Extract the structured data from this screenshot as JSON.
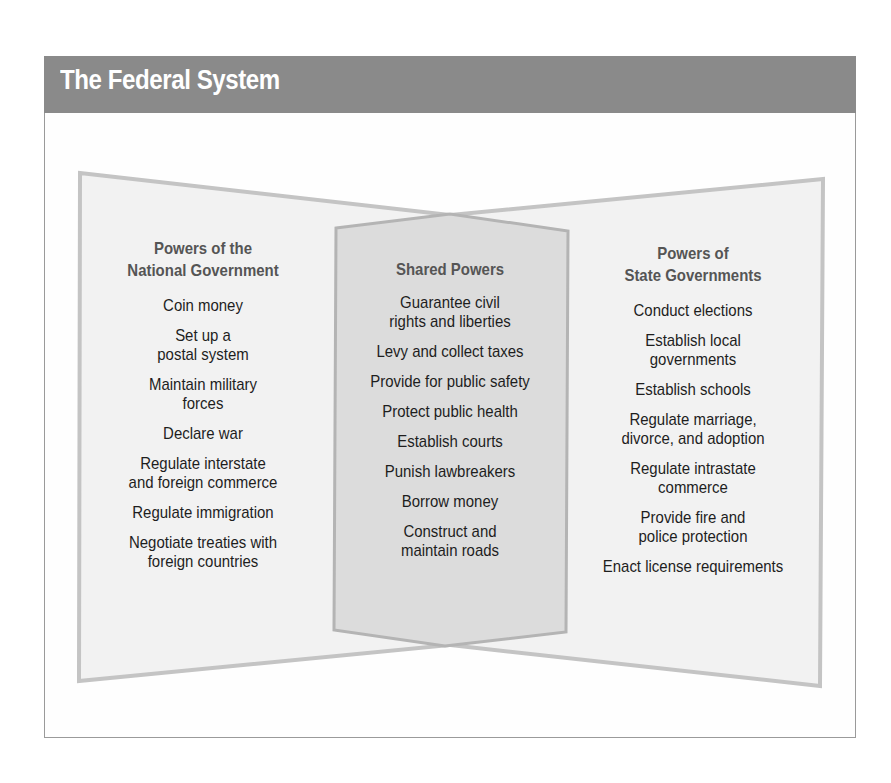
{
  "title": "The Federal System",
  "colors": {
    "header_bg": "#8a8a8a",
    "side_fill": "#f2f2f2",
    "side_stroke": "#c4c4c4",
    "middle_fill": "#dcdcdc",
    "middle_stroke": "#b4b4b4"
  },
  "national": {
    "heading": "Powers of the\nNational Government",
    "items": [
      "Coin money",
      "Set up a\npostal system",
      "Maintain military\nforces",
      "Declare war",
      "Regulate interstate\nand foreign commerce",
      "Regulate immigration",
      "Negotiate treaties with\nforeign countries"
    ]
  },
  "shared": {
    "heading": "Shared Powers",
    "items": [
      "Guarantee civil\nrights and liberties",
      "Levy and collect taxes",
      "Provide for public safety",
      "Protect public health",
      "Establish courts",
      "Punish lawbreakers",
      "Borrow money",
      "Construct and\nmaintain roads"
    ]
  },
  "state": {
    "heading": "Powers of\nState Governments",
    "items": [
      "Conduct elections",
      "Establish local\ngovernments",
      "Establish schools",
      "Regulate marriage,\ndivorce, and adoption",
      "Regulate intrastate\ncommerce",
      "Provide fire and\npolice protection",
      "Enact license requirements"
    ]
  }
}
